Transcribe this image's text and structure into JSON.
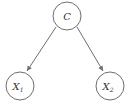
{
  "diagram": {
    "type": "directed-graph",
    "nodes": [
      {
        "id": "C",
        "label": "C",
        "subscript": "",
        "cx": 67,
        "cy": 16,
        "r": 14
      },
      {
        "id": "X1",
        "label": "X",
        "subscript": "1",
        "cx": 20,
        "cy": 86,
        "r": 14
      },
      {
        "id": "X2",
        "label": "X",
        "subscript": "2",
        "cx": 110,
        "cy": 86,
        "r": 14
      }
    ],
    "edges": [
      {
        "from": "C",
        "to": "X1"
      },
      {
        "from": "C",
        "to": "X2"
      }
    ],
    "colors": {
      "stroke": "#6e6e6e",
      "text": "#333333",
      "background": "#ffffff"
    }
  }
}
